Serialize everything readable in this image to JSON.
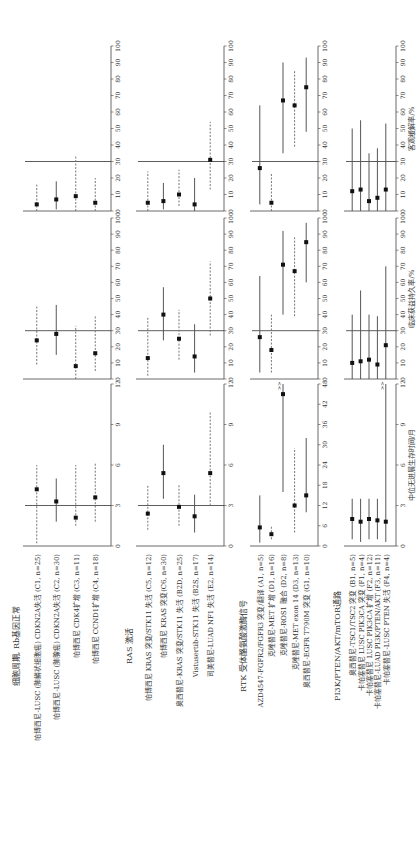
{
  "chart_data": {
    "type": "forest",
    "columns": [
      {
        "key": "pfs",
        "xlabel": "中位无进展生存时间/月",
        "default_ticks": [
          0,
          3,
          6,
          9,
          12
        ],
        "default_range": [
          0,
          12
        ]
      },
      {
        "key": "cbr",
        "xlabel": "临床获益持久率/%",
        "ticks": [
          0,
          10,
          20,
          30,
          40,
          50,
          60,
          70,
          80,
          90,
          100
        ],
        "range": [
          0,
          100
        ],
        "ref": 30
      },
      {
        "key": "orr",
        "xlabel": "客观缓解率/%",
        "ticks": [
          0,
          10,
          20,
          30,
          40,
          50,
          60,
          70,
          80,
          90,
          100
        ],
        "range": [
          0,
          100
        ],
        "ref": 30
      }
    ],
    "groups": [
      {
        "title": "细胞周期, Rb基因正常",
        "pfs_ticks": [
          0,
          3,
          6,
          9,
          12
        ],
        "pfs_range": [
          0,
          12
        ],
        "pfs_ref": 3,
        "rows": [
          {
            "label": "帕博西尼-LUSC (肺鳞状细胞癌) CDKN2A失活 (C1, n=25)",
            "style": "dashed",
            "pfs": [
              4.2,
              0.2,
              6.0
            ],
            "cbr": [
              24,
              9,
              45
            ],
            "orr": [
              4,
              0,
              16
            ]
          },
          {
            "label": "帕博西尼-LUSC (肺腺癌) CDKN2A失活 (C2, n=30)",
            "style": "solid",
            "pfs": [
              3.3,
              1.8,
              5.0
            ],
            "cbr": [
              28,
              15,
              46
            ],
            "orr": [
              7,
              1,
              18
            ]
          },
          {
            "label": "帕博西尼 CDK4扩增 (C3, n=11)",
            "style": "dashed",
            "pfs": [
              2.1,
              1.5,
              6.0
            ],
            "cbr": [
              8,
              0,
              33
            ],
            "orr": [
              9,
              0,
              33
            ]
          },
          {
            "label": "帕博西尼 CCND1扩增 (C4, n=18)",
            "style": "dashed",
            "pfs": [
              3.6,
              1.8,
              6.2
            ],
            "cbr": [
              16,
              5,
              39
            ],
            "orr": [
              5,
              0,
              20
            ]
          }
        ]
      },
      {
        "title": "RAS 激活",
        "pfs_ticks": [
          0,
          3,
          6,
          9,
          12
        ],
        "pfs_range": [
          0,
          12
        ],
        "pfs_ref": 3,
        "rows": [
          {
            "label": "帕博西尼 KRAS 突变/STK11 失活 (C5, n=12)",
            "style": "dashed",
            "pfs": [
              2.4,
              1.2,
              4.5
            ],
            "cbr": [
              13,
              2,
              38
            ],
            "orr": [
              5,
              0,
              24
            ]
          },
          {
            "label": "帕博西尼 KRAS 突变(C6, n=30)",
            "style": "solid",
            "pfs": [
              5.4,
              3.5,
              7.5
            ],
            "cbr": [
              40,
              24,
              57
            ],
            "orr": [
              6,
              1,
              17
            ]
          },
          {
            "label": "奥西替尼-KRAS 突变/STK11 失活 (B2D, n=25)",
            "style": "dashed",
            "pfs": [
              2.9,
              1.5,
              4.5
            ],
            "cbr": [
              25,
              12,
              43
            ],
            "orr": [
              10,
              3,
              25
            ]
          },
          {
            "label": "Vistusertib-STK11 失活 (B2S, n=17)",
            "style": "solid",
            "pfs": [
              2.2,
              1.0,
              3.8
            ],
            "cbr": [
              14,
              4,
              34
            ],
            "orr": [
              4,
              0,
              20
            ]
          },
          {
            "label": "司美替尼-LUAD NF1 失活 (E2, n=14)",
            "style": "dashed",
            "pfs": [
              5.4,
              3.0,
              9.9
            ],
            "cbr": [
              50,
              27,
              73
            ],
            "orr": [
              31,
              13,
              54
            ]
          }
        ]
      },
      {
        "title": "RTK 受体酪氨酸激酶信号",
        "pfs_ticks": [
          0,
          6,
          12,
          18,
          24,
          30,
          36,
          42,
          48
        ],
        "pfs_range": [
          0,
          48
        ],
        "pfs_ref": null,
        "rows": [
          {
            "label": "AZD4547-FGFR2/FGFR3 突变/翻译 (A1, n=5)",
            "style": "solid",
            "pfs": [
              5.5,
              1.0,
              15.0
            ],
            "cbr": [
              26,
              4,
              64
            ],
            "orr": [
              26,
              4,
              64
            ]
          },
          {
            "label": "克唑替尼-MET 扩增 (D1, n=16)",
            "style": "dashed",
            "pfs": [
              3.5,
              2.0,
              6.0
            ],
            "cbr": [
              18,
              4,
              40
            ],
            "orr": [
              5,
              0,
              23
            ]
          },
          {
            "label": "克唑替尼-ROS1 融合 (D2, n=8)",
            "style": "solid",
            "pfs": [
              45.0,
              16.0,
              ">48"
            ],
            "cbr": [
              71,
              40,
              92
            ],
            "orr": [
              67,
              35,
              90
            ]
          },
          {
            "label": "克唑替尼-MET exon 14 (D3, n=13)",
            "style": "dashed",
            "pfs": [
              12.0,
              4.0,
              29.0
            ],
            "cbr": [
              67,
              39,
              88
            ],
            "orr": [
              64,
              39,
              85
            ]
          },
          {
            "label": "奥西替尼-EGFR T790M 突变 (G1, n=10)",
            "style": "solid",
            "pfs": [
              15.0,
              10.0,
              32.0
            ],
            "cbr": [
              85,
              60,
              97
            ],
            "orr": [
              75,
              48,
              93
            ]
          }
        ]
      },
      {
        "title": "PI3K/PTEN/AKT/mTOR通路",
        "pfs_ticks": [
          0,
          3,
          6,
          9,
          12
        ],
        "pfs_range": [
          0,
          12
        ],
        "pfs_ref": null,
        "rows": [
          {
            "label": "奥西替尼-TSC1/TSC2 突变 (B1, n=5)",
            "style": "solid",
            "pfs": [
              2.0,
              0.5,
              3.5
            ],
            "cbr": [
              10,
              0,
              40
            ],
            "orr": [
              12,
              0,
              50
            ]
          },
          {
            "label": "卡帕塞替尼 LUSC PIK3CA 突变 (F1, n=4)",
            "style": "solid",
            "pfs": [
              1.8,
              0.3,
              3.5
            ],
            "cbr": [
              11,
              0,
              55
            ],
            "orr": [
              13,
              0,
              55
            ]
          },
          {
            "label": "卡帕塞替尼 LUSC PIK3CA 扩增 (F2, n=12)",
            "style": "solid",
            "pfs": [
              2.0,
              0.5,
              3.5
            ],
            "cbr": [
              12,
              0,
              40
            ],
            "orr": [
              6,
              0,
              35
            ]
          },
          {
            "label": "卡帕塞替尼-LUAD PI3K/PTEN/AKT (F3, n=11)",
            "style": "solid",
            "pfs": [
              1.9,
              0.5,
              3.5
            ],
            "cbr": [
              9,
              0,
              39
            ],
            "orr": [
              8,
              0,
              38
            ]
          },
          {
            "label": "卡帕塞替尼-LUSC PTEN 失活 (F4, n=4)",
            "style": "solid",
            "pfs": [
              1.8,
              0.3,
              ">12"
            ],
            "cbr": [
              21,
              0,
              70
            ],
            "orr": [
              13,
              0,
              53
            ]
          }
        ]
      }
    ]
  },
  "labels": {
    "pfs_axis": "中位无进展生存时间/月",
    "cbr_axis": "临床获益持久率/%",
    "orr_axis": "客观缓解率/%",
    "more_marker": ">>"
  }
}
